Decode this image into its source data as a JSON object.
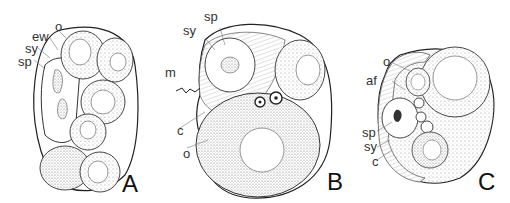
{
  "figure": {
    "panels": [
      {
        "id": "A",
        "label": "A",
        "annotations": [
          "o",
          "ew",
          "sy",
          "sp"
        ]
      },
      {
        "id": "B",
        "label": "B",
        "annotations": [
          "sp",
          "sy",
          "m",
          "c",
          "o"
        ]
      },
      {
        "id": "C",
        "label": "C",
        "annotations": [
          "o",
          "af",
          "sp",
          "sy",
          "c"
        ]
      }
    ]
  }
}
